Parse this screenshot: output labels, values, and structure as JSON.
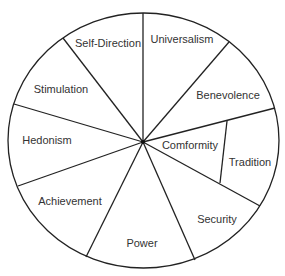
{
  "diagram": {
    "type": "circular value wheel",
    "center": {
      "x": 143,
      "y": 142
    },
    "colors": {
      "line": "#222222",
      "text": "#333333",
      "background": "#ffffff"
    },
    "segments": [
      {
        "label": "Self-Direction",
        "x": 108,
        "y": 47
      },
      {
        "label": "Universalism",
        "x": 182,
        "y": 43
      },
      {
        "label": "Benevolence",
        "x": 228,
        "y": 99
      },
      {
        "label": "Comformity",
        "x": 190,
        "y": 149
      },
      {
        "label": "Tradition",
        "x": 250,
        "y": 166
      },
      {
        "label": "Security",
        "x": 217,
        "y": 223
      },
      {
        "label": "Power",
        "x": 142,
        "y": 247
      },
      {
        "label": "Achievement",
        "x": 70,
        "y": 205
      },
      {
        "label": "Hedonism",
        "x": 47,
        "y": 144
      },
      {
        "label": "Stimulation",
        "x": 61,
        "y": 93
      }
    ]
  }
}
